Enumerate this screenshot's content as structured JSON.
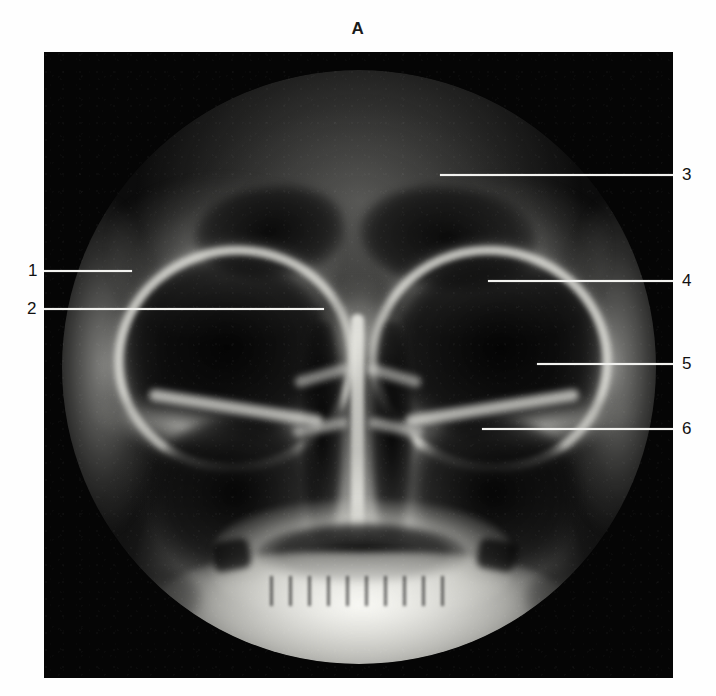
{
  "figure": {
    "panel_letter": "A",
    "modality": "radiograph",
    "view": "occipitomental (Waters') projection of the paranasal sinuses",
    "plate": {
      "x": 44,
      "y": 52,
      "width": 629,
      "height": 626,
      "background_color": "#050505",
      "field_shape": "circular collimated field"
    },
    "colors": {
      "page_background": "#fefefe",
      "plate_background": "#050505",
      "leader_line": "#f2f2ef",
      "label_text": "#111111"
    }
  },
  "labels": [
    {
      "id": "1",
      "text": "1",
      "side": "left",
      "label_x": 28,
      "label_y": 262,
      "line_y": 270,
      "line_x1": 44,
      "line_x2": 132
    },
    {
      "id": "2",
      "text": "2",
      "side": "left",
      "label_x": 27,
      "label_y": 300,
      "line_y": 308,
      "line_x1": 44,
      "line_x2": 324
    },
    {
      "id": "3",
      "text": "3",
      "side": "right",
      "label_x": 682,
      "label_y": 166,
      "line_y": 174,
      "line_x1": 440,
      "line_x2": 673
    },
    {
      "id": "4",
      "text": "4",
      "side": "right",
      "label_x": 682,
      "label_y": 272,
      "line_y": 280,
      "line_x1": 488,
      "line_x2": 673
    },
    {
      "id": "5",
      "text": "5",
      "side": "right",
      "label_x": 682,
      "label_y": 355,
      "line_y": 363,
      "line_x1": 537,
      "line_x2": 673
    },
    {
      "id": "6",
      "text": "6",
      "side": "right",
      "label_x": 682,
      "label_y": 420,
      "line_y": 428,
      "line_x1": 482,
      "line_x2": 673
    }
  ]
}
